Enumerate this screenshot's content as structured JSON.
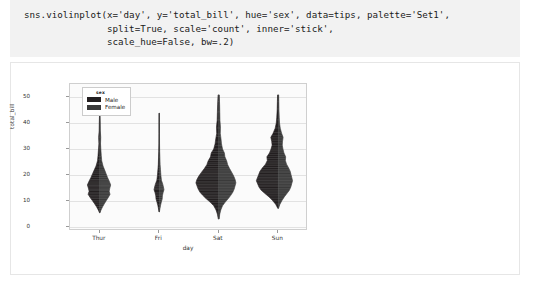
{
  "code_cell": {
    "lines": [
      "sns.violinplot(x='day', y='total_bill', hue='sex', data=tips, palette='Set1',",
      "               split=True, scale='count', inner='stick',",
      "               scale_hue=False, bw=.2)"
    ]
  },
  "chart_data": {
    "type": "violin",
    "title": "",
    "xlabel": "day",
    "ylabel": "total_bill",
    "categories": [
      "Thur",
      "Fri",
      "Sat",
      "Sun"
    ],
    "yticks": [
      0,
      10,
      20,
      30,
      40,
      50
    ],
    "ylim": [
      -1.5,
      55
    ],
    "grid": true,
    "legend": {
      "title": "sex",
      "position": "upper left",
      "entries": [
        {
          "label": "Male",
          "color": "#231f20"
        },
        {
          "label": "Female",
          "color": "#3a3a3a"
        }
      ]
    },
    "groups": [
      {
        "category": "Thur",
        "min": 5.5,
        "max": 43.1,
        "median": 16.2,
        "q1": 12.4,
        "q3": 20.2,
        "peak": 15.5,
        "male_max_width": 0.52,
        "female_max_width": 0.46,
        "profile": [
          {
            "y": 43.1,
            "w": 0.02
          },
          {
            "y": 40.0,
            "w": 0.04
          },
          {
            "y": 37.0,
            "w": 0.05
          },
          {
            "y": 34.5,
            "w": 0.09
          },
          {
            "y": 32.0,
            "w": 0.07
          },
          {
            "y": 30.0,
            "w": 0.1
          },
          {
            "y": 27.5,
            "w": 0.14
          },
          {
            "y": 25.5,
            "w": 0.18
          },
          {
            "y": 23.5,
            "w": 0.3
          },
          {
            "y": 22.0,
            "w": 0.44
          },
          {
            "y": 20.5,
            "w": 0.58
          },
          {
            "y": 19.0,
            "w": 0.72
          },
          {
            "y": 17.5,
            "w": 0.88
          },
          {
            "y": 16.2,
            "w": 1.0
          },
          {
            "y": 15.0,
            "w": 0.92
          },
          {
            "y": 13.8,
            "w": 0.86
          },
          {
            "y": 12.6,
            "w": 0.94
          },
          {
            "y": 11.4,
            "w": 0.78
          },
          {
            "y": 10.2,
            "w": 0.6
          },
          {
            "y": 9.0,
            "w": 0.42
          },
          {
            "y": 7.8,
            "w": 0.26
          },
          {
            "y": 6.6,
            "w": 0.12
          },
          {
            "y": 5.5,
            "w": 0.02
          }
        ],
        "sticks": [
          43.1,
          34.6,
          32.7,
          30.4,
          27.2,
          25.9,
          24.3,
          23.1,
          22.0,
          21.2,
          20.5,
          19.8,
          19.1,
          18.3,
          17.7,
          17.0,
          16.5,
          16.0,
          15.5,
          15.0,
          14.5,
          14.0,
          13.4,
          12.8,
          12.2,
          11.6,
          11.0,
          10.3,
          9.6,
          8.8,
          7.9,
          7.1,
          6.3,
          5.5
        ]
      },
      {
        "category": "Fri",
        "min": 5.8,
        "max": 43.8,
        "median": 15.4,
        "q1": 12.1,
        "q3": 21.5,
        "peak": 14.4,
        "male_max_width": 0.22,
        "female_max_width": 0.2,
        "profile": [
          {
            "y": 43.8,
            "w": 0.03
          },
          {
            "y": 40.0,
            "w": 0.05
          },
          {
            "y": 36.0,
            "w": 0.05
          },
          {
            "y": 32.0,
            "w": 0.06
          },
          {
            "y": 29.0,
            "w": 0.09
          },
          {
            "y": 26.5,
            "w": 0.14
          },
          {
            "y": 24.0,
            "w": 0.18
          },
          {
            "y": 22.0,
            "w": 0.26
          },
          {
            "y": 20.0,
            "w": 0.34
          },
          {
            "y": 18.0,
            "w": 0.46
          },
          {
            "y": 16.5,
            "w": 0.74
          },
          {
            "y": 15.4,
            "w": 0.88
          },
          {
            "y": 14.4,
            "w": 1.0
          },
          {
            "y": 13.2,
            "w": 0.8
          },
          {
            "y": 12.0,
            "w": 0.66
          },
          {
            "y": 10.8,
            "w": 0.62
          },
          {
            "y": 9.6,
            "w": 0.44
          },
          {
            "y": 8.4,
            "w": 0.28
          },
          {
            "y": 7.0,
            "w": 0.14
          },
          {
            "y": 5.8,
            "w": 0.03
          }
        ],
        "sticks": [
          43.8,
          40.2,
          28.9,
          26.9,
          22.8,
          22.0,
          21.0,
          19.8,
          18.3,
          16.9,
          16.3,
          15.8,
          15.4,
          14.8,
          14.4,
          13.4,
          12.7,
          12.2,
          11.4,
          10.6,
          9.9,
          8.6,
          7.5,
          5.8
        ]
      },
      {
        "category": "Sat",
        "min": 3.1,
        "max": 50.8,
        "median": 18.2,
        "q1": 13.4,
        "q3": 24.7,
        "peak": 17.0,
        "male_max_width": 0.96,
        "female_max_width": 0.72,
        "profile": [
          {
            "y": 50.8,
            "w": 0.03
          },
          {
            "y": 47.0,
            "w": 0.05
          },
          {
            "y": 44.0,
            "w": 0.06
          },
          {
            "y": 41.0,
            "w": 0.07
          },
          {
            "y": 38.5,
            "w": 0.1
          },
          {
            "y": 36.0,
            "w": 0.09
          },
          {
            "y": 34.0,
            "w": 0.13
          },
          {
            "y": 32.0,
            "w": 0.16
          },
          {
            "y": 30.0,
            "w": 0.22
          },
          {
            "y": 28.5,
            "w": 0.33
          },
          {
            "y": 27.0,
            "w": 0.36
          },
          {
            "y": 25.5,
            "w": 0.46
          },
          {
            "y": 24.0,
            "w": 0.52
          },
          {
            "y": 22.5,
            "w": 0.63
          },
          {
            "y": 21.0,
            "w": 0.76
          },
          {
            "y": 19.5,
            "w": 0.88
          },
          {
            "y": 18.2,
            "w": 0.96
          },
          {
            "y": 17.0,
            "w": 1.0
          },
          {
            "y": 15.8,
            "w": 0.95
          },
          {
            "y": 14.6,
            "w": 0.9
          },
          {
            "y": 13.4,
            "w": 0.82
          },
          {
            "y": 12.2,
            "w": 0.7
          },
          {
            "y": 11.0,
            "w": 0.56
          },
          {
            "y": 9.6,
            "w": 0.38
          },
          {
            "y": 8.2,
            "w": 0.22
          },
          {
            "y": 6.6,
            "w": 0.12
          },
          {
            "y": 5.0,
            "w": 0.06
          },
          {
            "y": 3.1,
            "w": 0.02
          }
        ],
        "sticks": [
          50.8,
          48.3,
          44.3,
          41.2,
          38.1,
          35.8,
          34.8,
          32.7,
          31.3,
          30.1,
          29.0,
          28.2,
          27.2,
          26.4,
          25.6,
          24.7,
          24.0,
          23.3,
          22.6,
          21.9,
          21.2,
          20.6,
          20.0,
          19.4,
          18.8,
          18.2,
          17.6,
          17.0,
          16.4,
          15.8,
          15.2,
          14.6,
          14.0,
          13.4,
          12.8,
          12.2,
          11.6,
          11.0,
          10.3,
          9.5,
          8.5,
          7.3,
          5.8,
          3.1
        ]
      },
      {
        "category": "Sun",
        "min": 7.2,
        "max": 50.8,
        "median": 19.6,
        "q1": 14.9,
        "q3": 25.6,
        "peak": 17.8,
        "male_max_width": 0.92,
        "female_max_width": 0.6,
        "profile": [
          {
            "y": 50.8,
            "w": 0.03
          },
          {
            "y": 48.0,
            "w": 0.04
          },
          {
            "y": 45.0,
            "w": 0.05
          },
          {
            "y": 42.0,
            "w": 0.07
          },
          {
            "y": 40.0,
            "w": 0.09
          },
          {
            "y": 38.0,
            "w": 0.14
          },
          {
            "y": 36.0,
            "w": 0.24
          },
          {
            "y": 34.5,
            "w": 0.34
          },
          {
            "y": 33.0,
            "w": 0.3
          },
          {
            "y": 31.5,
            "w": 0.28
          },
          {
            "y": 30.0,
            "w": 0.33
          },
          {
            "y": 28.5,
            "w": 0.4
          },
          {
            "y": 27.0,
            "w": 0.52
          },
          {
            "y": 25.6,
            "w": 0.5
          },
          {
            "y": 24.2,
            "w": 0.58
          },
          {
            "y": 22.8,
            "w": 0.72
          },
          {
            "y": 21.4,
            "w": 0.84
          },
          {
            "y": 20.0,
            "w": 0.9
          },
          {
            "y": 18.8,
            "w": 0.96
          },
          {
            "y": 17.8,
            "w": 1.0
          },
          {
            "y": 16.6,
            "w": 0.94
          },
          {
            "y": 15.4,
            "w": 0.88
          },
          {
            "y": 14.2,
            "w": 0.78
          },
          {
            "y": 13.0,
            "w": 0.62
          },
          {
            "y": 11.6,
            "w": 0.42
          },
          {
            "y": 10.2,
            "w": 0.26
          },
          {
            "y": 8.8,
            "w": 0.12
          },
          {
            "y": 7.2,
            "w": 0.02
          }
        ],
        "sticks": [
          50.8,
          48.2,
          45.4,
          41.2,
          38.1,
          36.4,
          35.3,
          34.3,
          33.4,
          32.4,
          31.3,
          30.4,
          29.6,
          28.8,
          28.0,
          27.2,
          26.4,
          25.7,
          25.0,
          24.3,
          23.6,
          22.9,
          22.2,
          21.5,
          20.9,
          20.3,
          19.7,
          19.1,
          18.5,
          17.9,
          17.3,
          16.7,
          16.1,
          15.5,
          14.9,
          14.2,
          13.5,
          12.8,
          12.0,
          11.1,
          10.1,
          8.9,
          7.2
        ]
      }
    ]
  }
}
